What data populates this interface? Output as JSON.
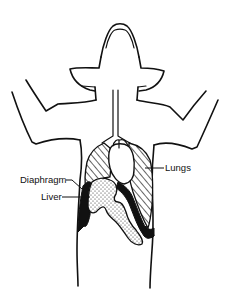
{
  "diagram": {
    "labels": {
      "lungs": "Lungs",
      "diaphragm": "Diaphragm",
      "liver": "Liver"
    },
    "colors": {
      "line": "#111111",
      "background": "#ffffff"
    }
  }
}
